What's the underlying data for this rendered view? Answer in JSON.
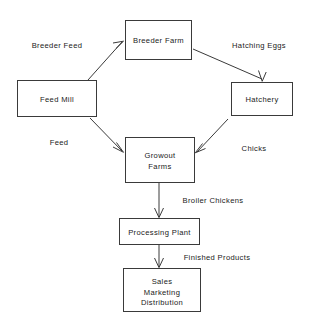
{
  "diagram": {
    "background_color": "#ffffff",
    "line_color": "#3a3a3a",
    "text_color": "#1a1a1a",
    "nodes": [
      {
        "id": "breeder-farm",
        "label": "Breeder Farm",
        "lines": [
          "Breeder Farm"
        ],
        "x": 125,
        "y": 20,
        "width": 66,
        "height": 39
      },
      {
        "id": "feed-mill",
        "label": "Feed Mill",
        "lines": [
          "Feed Mill"
        ],
        "x": 17,
        "y": 80,
        "width": 79,
        "height": 36
      },
      {
        "id": "hatchery",
        "label": "Hatchery",
        "lines": [
          "Hatchery"
        ],
        "x": 231,
        "y": 82,
        "width": 61,
        "height": 33
      },
      {
        "id": "growout-farms",
        "label": "Growout Farms",
        "lines": [
          "Growout",
          "Farms"
        ],
        "x": 125,
        "y": 137,
        "width": 69,
        "height": 45
      },
      {
        "id": "processing-plant",
        "label": "Processing Plant",
        "lines": [
          "Processing Plant"
        ],
        "x": 119,
        "y": 218,
        "width": 80,
        "height": 26
      },
      {
        "id": "sales-marketing-distribution",
        "label": "Sales Marketing Distribution",
        "lines": [
          "Sales",
          "Marketing",
          "Distribution"
        ],
        "x": 123,
        "y": 268,
        "width": 77,
        "height": 43
      }
    ],
    "edges": [
      {
        "id": "feed-mill-to-breeder-farm",
        "from": "feed-mill",
        "to": "breeder-farm",
        "label": "Breeder Feed",
        "label_x": 57,
        "label_y": 48
      },
      {
        "id": "breeder-farm-to-hatchery",
        "from": "breeder-farm",
        "to": "hatchery",
        "label": "Hatching Eggs",
        "label_x": 259,
        "label_y": 48
      },
      {
        "id": "feed-mill-to-growout-farms",
        "from": "feed-mill",
        "to": "growout-farms",
        "label": "Feed",
        "label_x": 59,
        "label_y": 145
      },
      {
        "id": "hatchery-to-growout-farms",
        "from": "hatchery",
        "to": "growout-farms",
        "label": "Chicks",
        "label_x": 254,
        "label_y": 151
      },
      {
        "id": "growout-farms-to-processing-plant",
        "from": "growout-farms",
        "to": "processing-plant",
        "label": "Broiler Chickens",
        "label_x": 213,
        "label_y": 203
      },
      {
        "id": "processing-plant-to-sales",
        "from": "processing-plant",
        "to": "sales-marketing-distribution",
        "label": "Finished Products",
        "label_x": 217,
        "label_y": 260
      }
    ]
  }
}
